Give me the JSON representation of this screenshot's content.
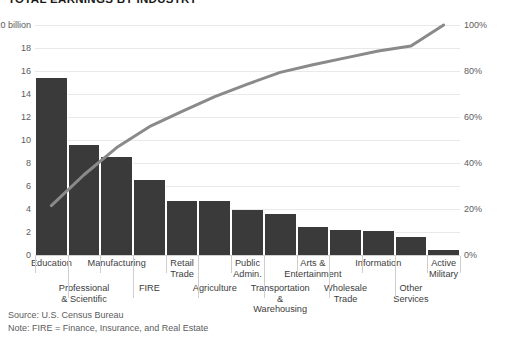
{
  "chart_data": {
    "type": "bar",
    "title": "TOTAL EARNINGS BY INDUSTRY",
    "xlabel": "",
    "ylabel": "$20 billion",
    "ylim": [
      0,
      20
    ],
    "y2lim": [
      0,
      100
    ],
    "grid": true,
    "legend": "none",
    "categories": [
      "Education",
      "Professional\n& Scientific",
      "Manufacturing",
      "FIRE",
      "Retail\nTrade",
      "Agriculture",
      "Public\nAdmin.",
      "Transportation\n&\nWarehousing",
      "Arts &\nEntertainment",
      "Wholesale\nTrade",
      "Information",
      "Other\nServices",
      "Active\nMilitary"
    ],
    "series": [
      {
        "name": "Total earnings",
        "type": "bar",
        "unit": "$ billion",
        "values": [
          15.4,
          9.6,
          8.5,
          6.5,
          4.7,
          4.7,
          3.9,
          3.6,
          2.4,
          2.2,
          2.1,
          1.6,
          0.4
        ]
      },
      {
        "name": "Cumulative share",
        "type": "line",
        "unit": "%",
        "axis": "right",
        "values": [
          21.5,
          34.9,
          46.7,
          55.8,
          62.4,
          68.9,
          74.3,
          79.4,
          82.7,
          85.7,
          88.7,
          90.9,
          100.0
        ]
      }
    ],
    "y_left_ticks": [
      "$20 billion",
      "18",
      "16",
      "14",
      "12",
      "10",
      "8",
      "6",
      "4",
      "2",
      "0"
    ],
    "y_left_tick_values": [
      20,
      18,
      16,
      14,
      12,
      10,
      8,
      6,
      4,
      2,
      0
    ],
    "y_right_ticks": [
      "100%",
      "80%",
      "60%",
      "40%",
      "20%",
      "0%"
    ],
    "y_right_tick_values": [
      100,
      80,
      60,
      40,
      20,
      0
    ],
    "colors": {
      "bar": "#3a3a3a",
      "line": "#8a8a8a",
      "grid": "#e9e9e9",
      "axis_text": "#5c5c5c",
      "title": "#1a1a1a",
      "background": "#ffffff"
    }
  },
  "footnotes": {
    "source": "Source: U.S. Census Bureau",
    "note": "Note: FIRE = Finance, Insurance, and Real Estate"
  }
}
